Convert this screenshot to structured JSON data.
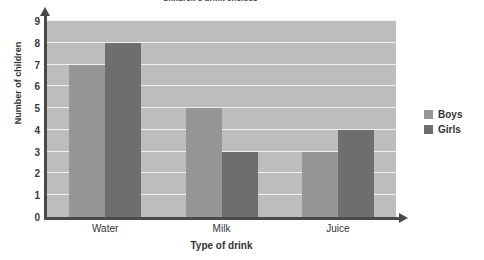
{
  "chart_data": {
    "type": "bar",
    "title": "Children's drink choices",
    "xlabel": "Type of drink",
    "ylabel": "Number of children",
    "categories": [
      "Water",
      "Milk",
      "Juice"
    ],
    "series": [
      {
        "name": "Boys",
        "values": [
          7,
          5,
          3
        ],
        "color": "#969696"
      },
      {
        "name": "Girls",
        "values": [
          8,
          3,
          4
        ],
        "color": "#6e6e6e"
      }
    ],
    "ylim": [
      0,
      9
    ],
    "yticks": [
      0,
      1,
      2,
      3,
      4,
      5,
      6,
      7,
      8,
      9
    ],
    "grid": true,
    "legend_position": "right",
    "plot_background": "#bdbdbd",
    "gridline_color": "#f2f2f2",
    "axis_color": "#4a4a4a"
  },
  "legend": {
    "entries": [
      {
        "label": "Boys"
      },
      {
        "label": "Girls"
      }
    ]
  }
}
